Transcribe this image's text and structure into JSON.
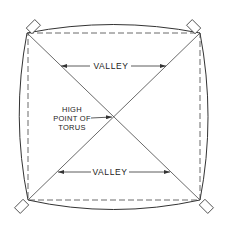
{
  "figure": {
    "type": "diagram",
    "labels": {
      "valley_top": "VALLEY",
      "valley_bottom": "VALLEY",
      "high_point_line1": "HIGH",
      "high_point_line2": "POINT OF",
      "high_point_line3": "TORUS"
    },
    "colors": {
      "line": "#333333",
      "background": "#ffffff"
    }
  }
}
